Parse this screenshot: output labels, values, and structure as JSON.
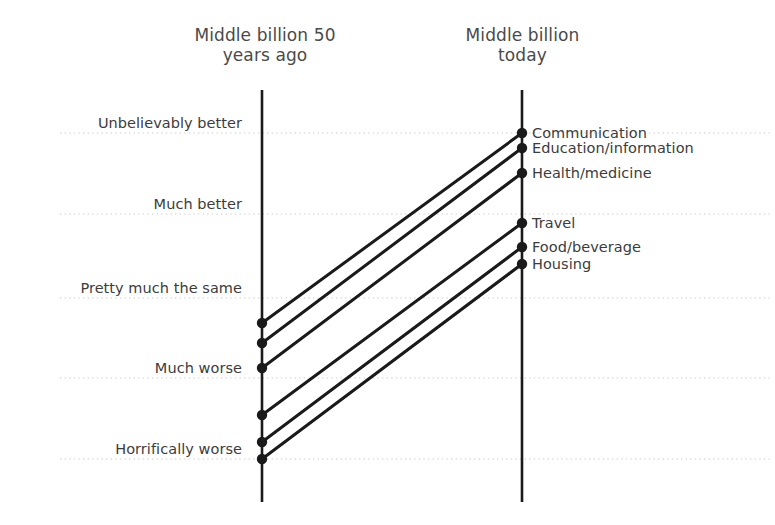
{
  "titles": {
    "left": "Middle billion 50\nyears ago",
    "right": "Middle billion\ntoday"
  },
  "colors": {
    "line": "#1a1a1a",
    "axis": "#1a1a1a",
    "gridline": "#cccccc",
    "text": "#3c3c3c",
    "title_text": "#4a4a4a",
    "background": "#ffffff"
  },
  "chart_data": {
    "type": "line",
    "subtype": "slope-chart",
    "title": "",
    "xlabel": "",
    "ylabel": "",
    "grid": true,
    "legend_position": "right-inline",
    "x": [
      "Middle billion 50 years ago",
      "Middle billion today"
    ],
    "scale_labels": [
      "Unbelievably better",
      "Much better",
      "Pretty much the same",
      "Much worse",
      "Horrifically worse"
    ],
    "scale_values": [
      2,
      1,
      0,
      -1,
      -2
    ],
    "ylim": [
      -2.4,
      2.4
    ],
    "series": [
      {
        "name": "Communication",
        "values": [
          -0.6,
          2.0
        ]
      },
      {
        "name": "Education/information",
        "values": [
          -0.85,
          1.8
        ]
      },
      {
        "name": "Health/medicine",
        "values": [
          -0.95,
          1.5
        ]
      },
      {
        "name": "Travel",
        "values": [
          -1.5,
          0.9
        ]
      },
      {
        "name": "Food/beverage",
        "values": [
          -1.8,
          0.6
        ]
      },
      {
        "name": "Housing",
        "values": [
          -2.0,
          0.4
        ]
      }
    ]
  },
  "geometry": {
    "left_axis_x": 262,
    "right_axis_x": 522,
    "axis_top_y": 90,
    "axis_bottom_y": 502,
    "gridlines_y": [
      133,
      214,
      298,
      378,
      459
    ],
    "left_points_y": [
      323,
      343,
      368,
      415,
      442,
      459
    ],
    "right_points_y": [
      133,
      148,
      173,
      223,
      247,
      264
    ],
    "label_x": 532,
    "dot_radius": 5.2,
    "line_width": 3.0,
    "axis_width": 2.6
  }
}
